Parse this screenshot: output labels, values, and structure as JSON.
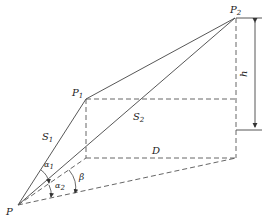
{
  "diagram": {
    "type": "geometry",
    "points": {
      "P": {
        "label": "P",
        "x": 18,
        "y": 205
      },
      "P1": {
        "label": "P",
        "sub": "1",
        "x": 86,
        "y": 99
      },
      "P2": {
        "label": "P",
        "sub": "2",
        "x": 235,
        "y": 18
      },
      "C1": {
        "x": 86,
        "y": 158
      },
      "C2": {
        "x": 236,
        "y": 158
      },
      "C3": {
        "x": 236,
        "y": 100
      }
    },
    "labels": {
      "S1": {
        "text": "S",
        "sub": "1"
      },
      "S2": {
        "text": "S",
        "sub": "2"
      },
      "D": {
        "text": "D"
      },
      "h": {
        "text": "h"
      },
      "alpha1": {
        "text": "α",
        "sub": "1"
      },
      "alpha2": {
        "text": "α",
        "sub": "2"
      },
      "beta": {
        "text": "β"
      }
    },
    "colors": {
      "line": "#333333",
      "text": "#222222",
      "background": "#ffffff"
    }
  }
}
